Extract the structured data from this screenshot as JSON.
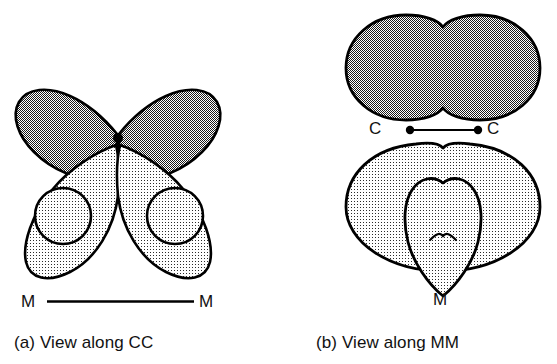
{
  "figure": {
    "background": "#ffffff",
    "width": 557,
    "height": 364,
    "stroke_color": "#000000"
  },
  "panels": [
    {
      "id": "a",
      "caption": "(a) View along CC",
      "axis_label_left": "M",
      "axis_label_right": "M",
      "axis_line": {
        "x1": 47,
        "y1": 302,
        "x2": 194,
        "y2": 302
      },
      "origin_dot": {
        "cx": 118,
        "cy": 138,
        "r": 5
      },
      "shapes": [
        {
          "name": "upper-left-dark-lobe",
          "fill": "dark",
          "kind": "teardrop"
        },
        {
          "name": "upper-right-dark-lobe",
          "fill": "dark",
          "kind": "teardrop"
        },
        {
          "name": "lower-left-light-lobe",
          "fill": "light",
          "kind": "crescent"
        },
        {
          "name": "lower-right-light-lobe",
          "fill": "light",
          "kind": "crescent"
        },
        {
          "name": "lower-left-light-circle",
          "fill": "light",
          "kind": "circle",
          "cx": 63,
          "cy": 216,
          "r": 28
        },
        {
          "name": "lower-right-light-circle",
          "fill": "light",
          "kind": "circle",
          "cx": 175,
          "cy": 216,
          "r": 28
        }
      ]
    },
    {
      "id": "b",
      "caption": "(b) View along MM",
      "axis_label_left": "C",
      "axis_label_right": "C",
      "axis_label_bottom": "M",
      "axis_line": {
        "x1": 410,
        "y1": 130,
        "x2": 478,
        "y2": 130
      },
      "axis_dots": [
        {
          "cx": 410,
          "cy": 130,
          "r": 4
        },
        {
          "cx": 478,
          "cy": 130,
          "r": 4
        }
      ],
      "shapes": [
        {
          "name": "upper-dark-bilobe",
          "fill": "dark",
          "kind": "peanut"
        },
        {
          "name": "lower-light-ellipse",
          "fill": "light",
          "kind": "ellipse",
          "cx": 443,
          "cy": 207,
          "rx": 97,
          "ry": 64
        },
        {
          "name": "lower-light-teardrop",
          "fill": "light",
          "kind": "teardrop-down"
        }
      ]
    }
  ],
  "fills": {
    "dark_label": "dark-checker-50",
    "dark_tone": "#6d6d6d",
    "light_label": "light-dot-25",
    "light_tone": "#e2e2e2"
  }
}
